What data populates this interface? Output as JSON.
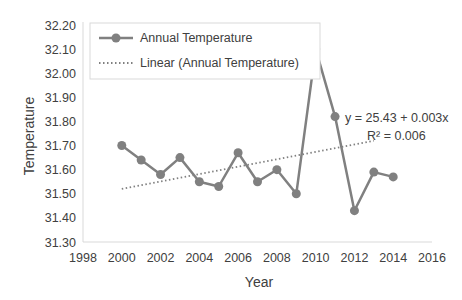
{
  "chart_data": {
    "type": "line",
    "title": "",
    "xlabel": "Year",
    "ylabel": "Temperature",
    "xlim": [
      1998,
      2016
    ],
    "ylim": [
      31.3,
      32.2
    ],
    "x_ticks": [
      "1998",
      "2000",
      "2002",
      "2004",
      "2006",
      "2008",
      "2010",
      "2012",
      "2014",
      "2016"
    ],
    "y_ticks": [
      "31.30",
      "31.40",
      "31.50",
      "31.60",
      "31.70",
      "31.80",
      "31.90",
      "32.00",
      "32.10",
      "32.20"
    ],
    "grid": false,
    "legend_position": "top-left inside",
    "series": [
      {
        "name": "Annual Temperature",
        "style": "solid line with circle markers",
        "color": "#808080",
        "x": [
          2000,
          2001,
          2002,
          2003,
          2004,
          2005,
          2006,
          2007,
          2008,
          2009,
          2010,
          2011,
          2012,
          2013,
          2014
        ],
        "values": [
          31.7,
          31.64,
          31.58,
          31.65,
          31.55,
          31.53,
          31.67,
          31.55,
          31.6,
          31.5,
          32.1,
          31.82,
          31.43,
          31.59,
          31.57
        ]
      },
      {
        "name": "Linear (Annual Temperature)",
        "style": "dotted trendline",
        "color": "#808080",
        "x": [
          2000,
          2013
        ],
        "values": [
          31.52,
          31.72
        ]
      }
    ],
    "annotations": [
      {
        "text": "y = 25.43 + 0.003x",
        "position": "right, near trendline end"
      },
      {
        "text": "R² = 0.006",
        "position": "right, below equation"
      }
    ]
  },
  "labels": {
    "xlabel": "Year",
    "ylabel": "Temperature",
    "legend_series": "Annual Temperature",
    "legend_trend": "Linear (Annual Temperature)",
    "equation": "y = 25.43 + 0.003x",
    "r_squared": "R² = 0.006"
  },
  "colors": {
    "series": "#808080",
    "axis": "#d9d9d9",
    "text": "#404040"
  }
}
